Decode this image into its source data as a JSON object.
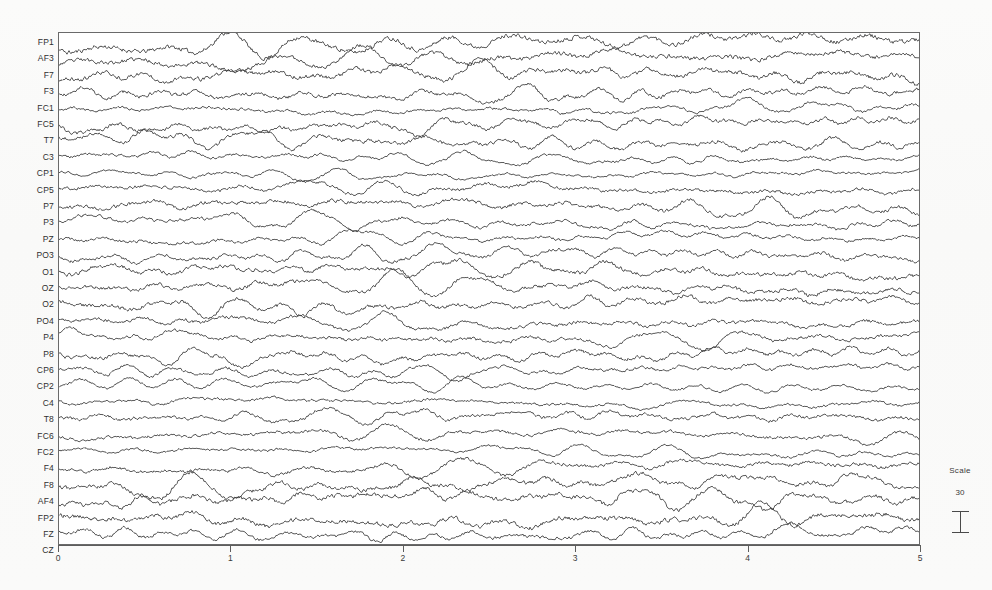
{
  "figure": {
    "background_color": "#fdfdfc",
    "trace_color": "#3a3a3a",
    "frame_color": "#6a6a6a"
  },
  "scale_legend": {
    "title": "Scale",
    "value": "30",
    "bar_icon": "i-beam-calibration-icon"
  },
  "chart_data": {
    "type": "line",
    "title": "",
    "subtitle": "",
    "xlabel": "",
    "ylabel": "",
    "xlim": [
      0,
      5
    ],
    "xticks": [
      0,
      1,
      2,
      3,
      4,
      5
    ],
    "xtick_labels": [
      "0",
      "1",
      "2",
      "3",
      "4",
      "5"
    ],
    "grid": false,
    "legend_position": "none",
    "plot_style": "stacked-multichannel-eeg",
    "channel_count": 31,
    "scale_bar_value": 30,
    "annotations": [
      "Scale",
      "30"
    ],
    "categories": [
      "FP1",
      "AF3",
      "F7",
      "F3",
      "FC1",
      "FC5",
      "T7",
      "C3",
      "CP1",
      "CP5",
      "P7",
      "P3",
      "PZ",
      "PO3",
      "O1",
      "OZ",
      "O2",
      "PO4",
      "P4",
      "P8",
      "CP6",
      "CP2",
      "C4",
      "T8",
      "FC6",
      "FC2",
      "F4",
      "F8",
      "AF4",
      "FP2",
      "FZ",
      "CZ"
    ],
    "series": [
      {
        "name": "FP1",
        "baseline": 42,
        "amplitude": 9.0,
        "seed": 11
      },
      {
        "name": "AF3",
        "baseline": 58,
        "amplitude": 8.2,
        "seed": 23
      },
      {
        "name": "F7",
        "baseline": 75,
        "amplitude": 8.6,
        "seed": 37
      },
      {
        "name": "F3",
        "baseline": 91,
        "amplitude": 7.4,
        "seed": 41
      },
      {
        "name": "FC1",
        "baseline": 108,
        "amplitude": 5.0,
        "seed": 53
      },
      {
        "name": "FC5",
        "baseline": 124,
        "amplitude": 7.0,
        "seed": 67
      },
      {
        "name": "T7",
        "baseline": 140,
        "amplitude": 7.6,
        "seed": 71
      },
      {
        "name": "C3",
        "baseline": 157,
        "amplitude": 5.2,
        "seed": 83
      },
      {
        "name": "CP1",
        "baseline": 173,
        "amplitude": 4.4,
        "seed": 97
      },
      {
        "name": "CP5",
        "baseline": 190,
        "amplitude": 6.6,
        "seed": 101
      },
      {
        "name": "P7",
        "baseline": 206,
        "amplitude": 7.2,
        "seed": 113
      },
      {
        "name": "P3",
        "baseline": 222,
        "amplitude": 6.0,
        "seed": 127
      },
      {
        "name": "PZ",
        "baseline": 239,
        "amplitude": 5.6,
        "seed": 131
      },
      {
        "name": "PO3",
        "baseline": 255,
        "amplitude": 6.4,
        "seed": 149
      },
      {
        "name": "O1",
        "baseline": 272,
        "amplitude": 7.8,
        "seed": 157
      },
      {
        "name": "OZ",
        "baseline": 288,
        "amplitude": 7.4,
        "seed": 163
      },
      {
        "name": "O2",
        "baseline": 304,
        "amplitude": 7.6,
        "seed": 179
      },
      {
        "name": "PO4",
        "baseline": 321,
        "amplitude": 6.8,
        "seed": 191
      },
      {
        "name": "P4",
        "baseline": 337,
        "amplitude": 6.2,
        "seed": 197
      },
      {
        "name": "P8",
        "baseline": 354,
        "amplitude": 7.0,
        "seed": 211
      },
      {
        "name": "CP6",
        "baseline": 370,
        "amplitude": 5.8,
        "seed": 223
      },
      {
        "name": "CP2",
        "baseline": 386,
        "amplitude": 4.8,
        "seed": 227
      },
      {
        "name": "C4",
        "baseline": 403,
        "amplitude": 5.0,
        "seed": 239
      },
      {
        "name": "T8",
        "baseline": 419,
        "amplitude": 6.4,
        "seed": 251
      },
      {
        "name": "FC6",
        "baseline": 436,
        "amplitude": 6.0,
        "seed": 263
      },
      {
        "name": "FC2",
        "baseline": 452,
        "amplitude": 4.6,
        "seed": 277
      },
      {
        "name": "F4",
        "baseline": 468,
        "amplitude": 6.6,
        "seed": 281
      },
      {
        "name": "F8",
        "baseline": 485,
        "amplitude": 8.0,
        "seed": 293
      },
      {
        "name": "AF4",
        "baseline": 501,
        "amplitude": 8.4,
        "seed": 307
      },
      {
        "name": "FP2",
        "baseline": 518,
        "amplitude": 8.8,
        "seed": 311
      },
      {
        "name": "FZ",
        "baseline": 534,
        "amplitude": 6.2,
        "seed": 317
      }
    ]
  }
}
